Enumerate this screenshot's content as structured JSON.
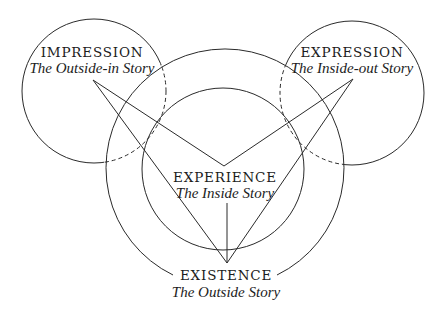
{
  "nodes": {
    "impression": {
      "title": "IMPRESSION",
      "subtitle": "The Outside-in Story"
    },
    "expression": {
      "title": "EXPRESSION",
      "subtitle": "The Inside-out Story"
    },
    "experience": {
      "title": "EXPERIENCE",
      "subtitle": "The Inside Story"
    },
    "existence": {
      "title": "EXISTENCE",
      "subtitle": "The Outside Story"
    }
  },
  "colors": {
    "line": "#2a2a2a",
    "text": "#1c1c1c",
    "background": "#ffffff"
  }
}
